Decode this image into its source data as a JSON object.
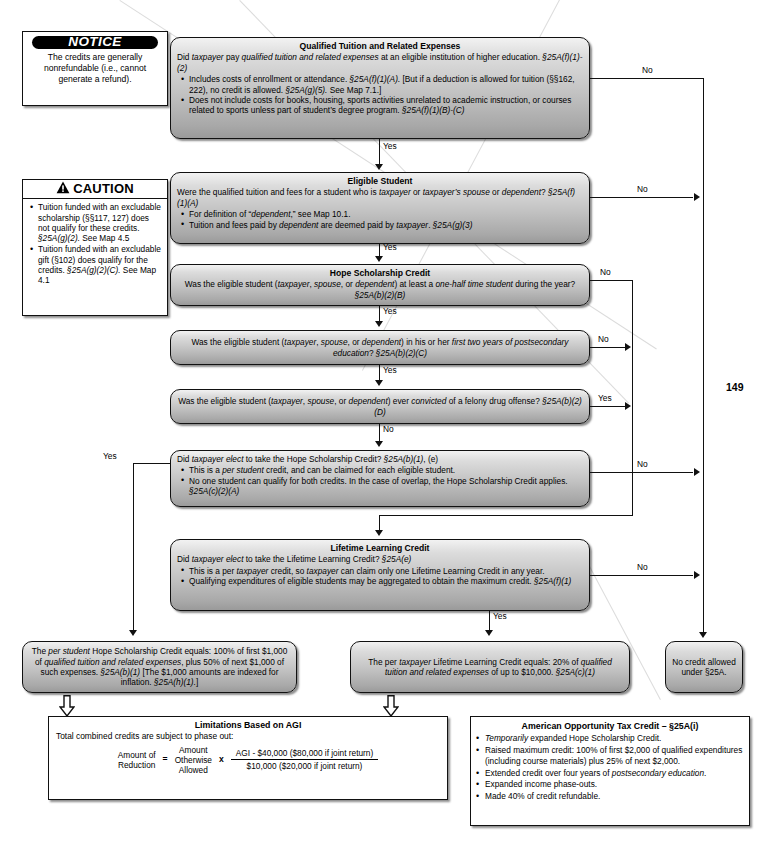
{
  "page": {
    "number": "149"
  },
  "notice": {
    "banner": "NOTICE",
    "text": "The credits are generally nonrefundable (i.e., cannot generate a refund)."
  },
  "caution": {
    "banner": "CAUTION",
    "items": [
      "Tuition funded with an excludable scholarship (§§117, 127) does not qualify for these credits.  §25A(g)(2).  See Map 4.5",
      "Tuition funded with an excludable gift (§102) does qualify for the credits.  §25A(g)(2)(C).  See Map 4.1"
    ]
  },
  "nodes": {
    "qualified_tuition": {
      "header": "Qualified Tuition and Related Expenses",
      "question": "Did taxpayer pay qualified tuition and related expenses at an eligible institution of higher education.  §25A(f)(1)-(2)",
      "bullets": [
        "Includes costs of enrollment or attendance.  §25A(f)(1)(A).  [But if a deduction is allowed for tuition (§§162, 222), no credit is allowed.  §25A(g)(5).  See Map 7.1.]",
        "Does not include costs for books, housing, sports activities unrelated to academic instruction, or courses related to sports unless part of student’s degree program.  §25A(f)(1)(B)-(C)"
      ]
    },
    "eligible_student": {
      "header": "Eligible Student",
      "question": "Were the qualified tuition and fees for a student who is taxpayer or taxpayer’s spouse or dependent?  §25A(f)(1)(A)",
      "bullets": [
        "For definition of “dependent,” see Map 10.1.",
        "Tuition and fees paid by dependent are deemed paid by taxpayer.  §25A(g)(3)"
      ]
    },
    "hope_halftime": {
      "header": "Hope Scholarship Credit",
      "question": "Was the eligible student (taxpayer, spouse, or dependent) at least a one-half time student during the year?  §25A(b)(2)(B)"
    },
    "hope_firsttwo": {
      "question": "Was the eligible student (taxpayer, spouse, or dependent) in his or her first two years of postsecondary education?  §25A(b)(2)(C)"
    },
    "hope_felony": {
      "question": "Was the eligible student (taxpayer, spouse, or dependent) ever convicted of a felony drug offense?  §25A(b)(2)(D)"
    },
    "hope_elect": {
      "question": "Did taxpayer elect to take the Hope Scholarship Credit?  §25A(b)(1), (e)",
      "bullets": [
        "This is a per student credit, and can be claimed for each eligible student.",
        "No one student can qualify for both credits.  In the case of overlap, the Hope Scholarship Credit applies.  §25A(c)(2)(A)"
      ]
    },
    "lifetime_elect": {
      "header": "Lifetime Learning Credit",
      "question": "Did taxpayer elect to take the Lifetime Learning Credit?  §25A(e)",
      "bullets": [
        "This is a per taxpayer credit, so taxpayer can claim only one Lifetime Learning Credit in any year.",
        "Qualifying expenditures of eligible students may be aggregated to obtain the maximum credit.  §25A(f)(1)"
      ]
    },
    "hope_result": {
      "text": "The per student Hope Scholarship Credit equals:  100% of first $1,000 of qualified tuition and related expenses, plus 50% of next $1,000 of such expenses.  §25A(b)(1)  [The $1,000 amounts are indexed for inflation.  §25A(h)(1).]"
    },
    "lifetime_result": {
      "text": "The per taxpayer Lifetime Learning Credit equals:  20% of qualified tuition and related expenses of up to $10,000.  §25A(c)(1)"
    },
    "no_credit": {
      "text": "No credit allowed under §25A."
    }
  },
  "agi": {
    "header": "Limitations Based on AGI",
    "subtext": "Total combined credits are subject to phase out:",
    "formula": {
      "left_line1": "Amount of",
      "left_line2": "Reduction",
      "equals": "=",
      "mid_line1": "Amount",
      "mid_line2": "Otherwise",
      "mid_line3": "Allowed",
      "times": "x",
      "numerator": "AGI - $40,000 ($80,000 if joint return)",
      "denominator": "$10,000 ($20,000 if joint return)"
    }
  },
  "aotc": {
    "header": "American Opportunity Tax Credit – §25A(i)",
    "items": [
      "Temporarily expanded Hope Scholarship Credit.",
      "Raised maximum credit:  100% of first $2,000 of qualified expenditures (including course materials) plus 25% of next $2,000.",
      "Extended credit over four years of postsecondary education.",
      "Expanded income phase-outs.",
      "Made 40% of credit refundable."
    ]
  },
  "edge_labels": {
    "qt_yes": "Yes",
    "qt_no": "No",
    "es_yes": "Yes",
    "es_no": "No",
    "hh_yes": "Yes",
    "hh_no": "No",
    "hf2_yes": "Yes",
    "hf2_no": "No",
    "hfel_no": "No",
    "hfel_yes": "Yes",
    "he_yes": "Yes",
    "he_no": "No",
    "ll_yes": "Yes",
    "ll_no": "No"
  },
  "colors": {
    "box_border": "#111111",
    "line": "#111111",
    "box_fill_light": "#f2f2f2",
    "box_fill_dark": "#9a9a9a",
    "banner_bg": "#000000"
  }
}
